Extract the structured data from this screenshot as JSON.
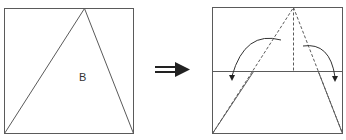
{
  "diagram": {
    "left_panel": {
      "region_label": "B"
    },
    "arrow": {
      "icon": "double-arrow-right-icon"
    },
    "right_panel": {
      "fold_arrows": [
        "curved-arrow-left-down",
        "curved-arrow-right-down"
      ]
    },
    "colors": {
      "stroke": "#555555",
      "arrow": "#222222"
    }
  }
}
